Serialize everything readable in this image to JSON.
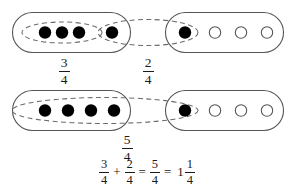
{
  "diagram": {
    "background_color": "#ffffff",
    "line_color": "#555555",
    "dashed_color": "#6b6b6b",
    "filled_dot_color": "#000000",
    "open_dot_color": "#ffffff",
    "open_dot_stroke": "#555555",
    "text_color": "#1a1a1a"
  },
  "rows": [
    {
      "id": "row-top",
      "left_group": {
        "name": "top-left-whole",
        "capacity": 4,
        "filled": 4,
        "dots": [
          "filled",
          "filled",
          "filled",
          "filled"
        ],
        "circled_count": 3,
        "label": {
          "numerator": "3",
          "denominator": "4"
        }
      },
      "right_group": {
        "name": "top-right-whole",
        "capacity": 4,
        "filled": 1,
        "dots": [
          "filled",
          "open",
          "open",
          "open"
        ]
      },
      "bridge": {
        "name": "top-bridge-ellipse",
        "circled_count": 2,
        "label": {
          "numerator": "2",
          "denominator": "4"
        }
      }
    },
    {
      "id": "row-bottom",
      "left_group": {
        "name": "bottom-left-whole",
        "capacity": 4,
        "filled": 4,
        "dots": [
          "filled",
          "filled",
          "filled",
          "filled"
        ],
        "circled_count": 4
      },
      "right_group": {
        "name": "bottom-right-whole",
        "capacity": 4,
        "filled": 1,
        "dots": [
          "filled",
          "open",
          "open",
          "open"
        ]
      },
      "bridge": {
        "name": "bottom-bridge-ellipse",
        "circled_count": 5,
        "label": {
          "numerator": "5",
          "denominator": "4"
        }
      }
    }
  ],
  "equation": {
    "term1": {
      "numerator": "3",
      "denominator": "4"
    },
    "plus": "+",
    "term2": {
      "numerator": "2",
      "denominator": "4"
    },
    "equals1": "=",
    "result": {
      "numerator": "5",
      "denominator": "4"
    },
    "equals2": "=",
    "mixed_whole": "1",
    "mixed_fraction": {
      "numerator": "1",
      "denominator": "4"
    }
  }
}
